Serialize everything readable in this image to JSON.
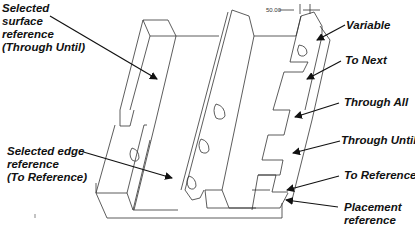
{
  "diagram": {
    "dimension": "50.00",
    "labels_left": [
      {
        "id": "selected-surface",
        "lines": [
          "Selected",
          "surface",
          "reference",
          "(Through Until)"
        ]
      },
      {
        "id": "selected-edge",
        "lines": [
          "Selected edge",
          "reference",
          "(To Reference)"
        ]
      }
    ],
    "labels_right": [
      {
        "id": "variable",
        "lines": [
          "Variable"
        ]
      },
      {
        "id": "to-next",
        "lines": [
          "To Next"
        ]
      },
      {
        "id": "through-all",
        "lines": [
          "Through All"
        ]
      },
      {
        "id": "through-until",
        "lines": [
          "Through Until"
        ]
      },
      {
        "id": "to-reference",
        "lines": [
          "To Reference"
        ]
      },
      {
        "id": "placement-reference",
        "lines": [
          "Placement",
          "reference"
        ]
      }
    ],
    "colors": {
      "line": "#222222",
      "background": "#ffffff"
    }
  }
}
